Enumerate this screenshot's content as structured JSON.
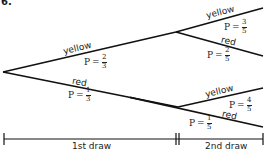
{
  "problem_number": "6.",
  "tree": {
    "first_draw": {
      "yellow": {
        "label": "yellow",
        "p_prefix": "P",
        "num": "2",
        "den": "3"
      },
      "red": {
        "label": "red",
        "p_prefix": "P",
        "num": "1",
        "den": "3"
      }
    },
    "second_draw_after_yellow": {
      "yellow": {
        "label": "yellow",
        "p_prefix": "P",
        "num": "3",
        "den": "5"
      },
      "red": {
        "label": "red",
        "p_prefix": "P",
        "num": "2",
        "den": "5"
      }
    },
    "second_draw_after_red": {
      "yellow": {
        "label": "yellow",
        "p_prefix": "P",
        "num": "4",
        "den": "5"
      },
      "red": {
        "label": "red",
        "p_prefix": "P",
        "num": "1",
        "den": "5"
      }
    }
  },
  "timeline": {
    "first_label": "1st draw",
    "second_label": "2nd draw"
  },
  "equals": "="
}
